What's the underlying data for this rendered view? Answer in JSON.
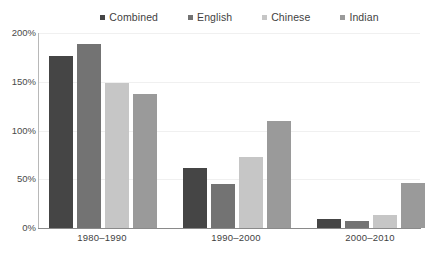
{
  "legend": {
    "position": "top-center",
    "items": [
      {
        "label": "Combined",
        "color": "#454545",
        "marker": "square-marker-icon"
      },
      {
        "label": "English",
        "color": "#737373",
        "marker": "square-marker-icon"
      },
      {
        "label": "Chinese",
        "color": "#c6c6c6",
        "marker": "square-marker-icon"
      },
      {
        "label": "Indian",
        "color": "#9a9a9a",
        "marker": "square-marker-icon"
      }
    ]
  },
  "axes": {
    "y_ticks": [
      "200%",
      "150%",
      "100%",
      "50%",
      "0%"
    ],
    "x_ticks": [
      "1980–1990",
      "1990–2000",
      "2000–2010"
    ]
  },
  "chart_data": {
    "type": "bar",
    "title": "",
    "subtitle": "",
    "xlabel": "",
    "ylabel": "",
    "ylim": [
      0,
      200
    ],
    "yticks": [
      0,
      50,
      100,
      150,
      200
    ],
    "ytick_labels": [
      "0%",
      "50%",
      "100%",
      "150%",
      "200%"
    ],
    "grid": true,
    "grid_axis": "y",
    "legend_position": "top-center",
    "categories": [
      "1980–1990",
      "1990–2000",
      "2000–2010"
    ],
    "series": [
      {
        "name": "Combined",
        "color": "#454545",
        "values": [
          176,
          62,
          9
        ]
      },
      {
        "name": "English",
        "color": "#737373",
        "values": [
          189,
          45,
          7
        ]
      },
      {
        "name": "Chinese",
        "color": "#c6c6c6",
        "values": [
          149,
          73,
          13
        ]
      },
      {
        "name": "Indian",
        "color": "#9a9a9a",
        "values": [
          137,
          110,
          46
        ]
      }
    ]
  }
}
